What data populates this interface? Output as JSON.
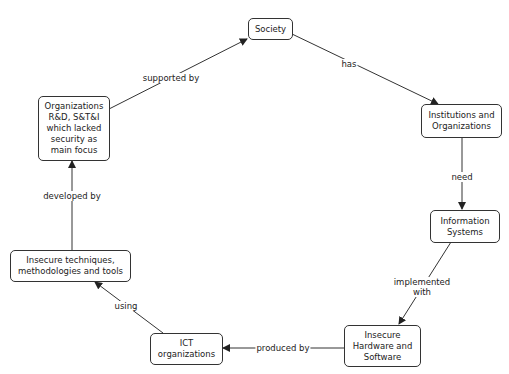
{
  "diagram": {
    "type": "concept-map",
    "nodes": {
      "society": "Society",
      "institutions": "Institutions and\nOrganizations",
      "information_systems": "Information\nSystems",
      "insecure_hardware": "Insecure\nHardware and\nSoftware",
      "ict_organizations": "ICT\norganizations",
      "insecure_techniques": "Insecure techniques,\nmethodologies and tools",
      "organizations_rd": "Organizations\nR&D, S&T&I\nwhich lacked\nsecurity as\nmain focus"
    },
    "edges": {
      "has": "has",
      "need": "need",
      "implemented_with": "implemented\nwith",
      "produced_by": "produced by",
      "using": "using",
      "developed_by": "developed by",
      "supported_by": "supported by"
    },
    "relations": [
      {
        "from": "Society",
        "label": "has",
        "to": "Institutions and Organizations"
      },
      {
        "from": "Institutions and Organizations",
        "label": "need",
        "to": "Information Systems"
      },
      {
        "from": "Information Systems",
        "label": "implemented with",
        "to": "Insecure Hardware and Software"
      },
      {
        "from": "Insecure Hardware and Software",
        "label": "produced by",
        "to": "ICT organizations"
      },
      {
        "from": "ICT organizations",
        "label": "using",
        "to": "Insecure techniques, methodologies and tools"
      },
      {
        "from": "Insecure techniques, methodologies and tools",
        "label": "developed by",
        "to": "Organizations R&D, S&T&I which lacked security as main focus"
      },
      {
        "from": "Organizations R&D, S&T&I which lacked security as main focus",
        "label": "supported by",
        "to": "Society"
      }
    ],
    "colors": {
      "line": "#333333",
      "background": "#ffffff",
      "text": "#222222"
    }
  }
}
